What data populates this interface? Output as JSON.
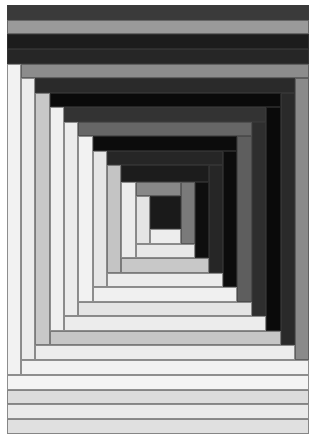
{
  "figure": {
    "caption": "",
    "bounds": {
      "left": 7,
      "top": 5,
      "right": 309,
      "bottom": 434
    }
  },
  "palette": {
    "black": "#0b0b0b",
    "very_dark": "#1e1e1e",
    "dark": "#2c2c2c",
    "mid_dark": "#3a3a3a",
    "gray": "#8c8c8c",
    "mid_gray": "#666666",
    "light_gray": "#c6c6c6",
    "off_white": "#ececec",
    "white": "#f3f3f3"
  },
  "patches": [
    {
      "name": "top-band-1",
      "x": 7,
      "y": 5,
      "w": 302,
      "h": 15,
      "color": "#3a3a3a"
    },
    {
      "name": "top-band-2",
      "x": 7,
      "y": 20,
      "w": 302,
      "h": 14,
      "color": "#9a9a9a"
    },
    {
      "name": "top-band-3",
      "x": 7,
      "y": 34,
      "w": 302,
      "h": 15,
      "color": "#1c1c1c"
    },
    {
      "name": "top-band-4",
      "x": 7,
      "y": 49,
      "w": 302,
      "h": 15,
      "color": "#262626"
    },
    {
      "name": "left-strip-0",
      "x": 7,
      "y": 64,
      "w": 14,
      "h": 311,
      "color": "#f2f2f2"
    },
    {
      "name": "top-strip-0",
      "x": 21,
      "y": 64,
      "w": 288,
      "h": 14,
      "color": "#8c8c8c"
    },
    {
      "name": "right-strip-0",
      "x": 295,
      "y": 78,
      "w": 14,
      "h": 282,
      "color": "#8a8a8a"
    },
    {
      "name": "bottom-strip-0",
      "x": 21,
      "y": 360,
      "w": 288,
      "h": 15,
      "color": "#f2f2f2"
    },
    {
      "name": "left-strip-1",
      "x": 21,
      "y": 78,
      "w": 14,
      "h": 282,
      "color": "#ececec"
    },
    {
      "name": "top-strip-1",
      "x": 35,
      "y": 78,
      "w": 260,
      "h": 15,
      "color": "#2a2a2a"
    },
    {
      "name": "right-strip-1",
      "x": 281,
      "y": 93,
      "w": 14,
      "h": 252,
      "color": "#2a2a2a"
    },
    {
      "name": "bottom-strip-1",
      "x": 35,
      "y": 345,
      "w": 260,
      "h": 15,
      "color": "#ececec"
    },
    {
      "name": "left-strip-2",
      "x": 35,
      "y": 93,
      "w": 15,
      "h": 252,
      "color": "#c8c8c8"
    },
    {
      "name": "top-strip-2",
      "x": 50,
      "y": 93,
      "w": 231,
      "h": 14,
      "color": "#0a0a0a"
    },
    {
      "name": "right-strip-2",
      "x": 266,
      "y": 107,
      "w": 15,
      "h": 224,
      "color": "#0a0a0a"
    },
    {
      "name": "bottom-strip-2",
      "x": 50,
      "y": 331,
      "w": 231,
      "h": 14,
      "color": "#c6c6c6"
    },
    {
      "name": "left-strip-3",
      "x": 50,
      "y": 107,
      "w": 14,
      "h": 224,
      "color": "#f0f0f0"
    },
    {
      "name": "top-strip-3",
      "x": 64,
      "y": 107,
      "w": 202,
      "h": 15,
      "color": "#333333"
    },
    {
      "name": "right-strip-3",
      "x": 252,
      "y": 122,
      "w": 14,
      "h": 194,
      "color": "#2e2e2e"
    },
    {
      "name": "bottom-strip-3",
      "x": 64,
      "y": 316,
      "w": 202,
      "h": 15,
      "color": "#ececec"
    },
    {
      "name": "left-strip-4",
      "x": 64,
      "y": 122,
      "w": 14,
      "h": 194,
      "color": "#ececec"
    },
    {
      "name": "top-strip-4",
      "x": 78,
      "y": 122,
      "w": 174,
      "h": 14,
      "color": "#666666"
    },
    {
      "name": "right-strip-4",
      "x": 237,
      "y": 136,
      "w": 15,
      "h": 166,
      "color": "#5e5e5e"
    },
    {
      "name": "bottom-strip-4",
      "x": 78,
      "y": 302,
      "w": 174,
      "h": 14,
      "color": "#e4e4e4"
    },
    {
      "name": "left-strip-5",
      "x": 78,
      "y": 136,
      "w": 15,
      "h": 166,
      "color": "#f2f2f2"
    },
    {
      "name": "top-strip-5",
      "x": 93,
      "y": 136,
      "w": 144,
      "h": 15,
      "color": "#0c0c0c"
    },
    {
      "name": "right-strip-5",
      "x": 223,
      "y": 151,
      "w": 14,
      "h": 136,
      "color": "#0c0c0c"
    },
    {
      "name": "bottom-strip-5",
      "x": 93,
      "y": 287,
      "w": 144,
      "h": 15,
      "color": "#f0f0f0"
    },
    {
      "name": "left-strip-6",
      "x": 93,
      "y": 151,
      "w": 14,
      "h": 136,
      "color": "#e6e6e6"
    },
    {
      "name": "top-strip-6",
      "x": 107,
      "y": 151,
      "w": 116,
      "h": 14,
      "color": "#262626"
    },
    {
      "name": "right-strip-6",
      "x": 209,
      "y": 165,
      "w": 14,
      "h": 108,
      "color": "#262626"
    },
    {
      "name": "bottom-strip-6",
      "x": 107,
      "y": 273,
      "w": 116,
      "h": 14,
      "color": "#ececec"
    },
    {
      "name": "left-strip-7",
      "x": 107,
      "y": 165,
      "w": 14,
      "h": 108,
      "color": "#c4c4c4"
    },
    {
      "name": "top-strip-7",
      "x": 121,
      "y": 165,
      "w": 88,
      "h": 17,
      "color": "#1c1c1c"
    },
    {
      "name": "right-strip-7",
      "x": 195,
      "y": 182,
      "w": 14,
      "h": 76,
      "color": "#0e0e0e"
    },
    {
      "name": "bottom-strip-7",
      "x": 121,
      "y": 258,
      "w": 88,
      "h": 15,
      "color": "#c8c8c8"
    },
    {
      "name": "left-strip-8",
      "x": 121,
      "y": 182,
      "w": 15,
      "h": 76,
      "color": "#ececec"
    },
    {
      "name": "top-strip-8",
      "x": 136,
      "y": 182,
      "w": 45,
      "h": 14,
      "color": "#888888"
    },
    {
      "name": "right-strip-8",
      "x": 181,
      "y": 182,
      "w": 14,
      "h": 62,
      "color": "#7a7a7a"
    },
    {
      "name": "bottom-strip-8",
      "x": 136,
      "y": 244,
      "w": 59,
      "h": 14,
      "color": "#e8e8e8"
    },
    {
      "name": "left-strip-9",
      "x": 136,
      "y": 196,
      "w": 14,
      "h": 48,
      "color": "#e4e4e4"
    },
    {
      "name": "center-square",
      "x": 150,
      "y": 196,
      "w": 31,
      "h": 33,
      "color": "#1a1a1a"
    },
    {
      "name": "bottom-strip-9",
      "x": 150,
      "y": 229,
      "w": 31,
      "h": 15,
      "color": "#ededed"
    },
    {
      "name": "bottom-band-1",
      "x": 7,
      "y": 375,
      "w": 302,
      "h": 15,
      "color": "#f4f4f4"
    },
    {
      "name": "bottom-band-2",
      "x": 7,
      "y": 390,
      "w": 302,
      "h": 14,
      "color": "#dcdcdc"
    },
    {
      "name": "bottom-band-3",
      "x": 7,
      "y": 404,
      "w": 302,
      "h": 15,
      "color": "#eaeaea"
    },
    {
      "name": "bottom-band-4",
      "x": 7,
      "y": 419,
      "w": 302,
      "h": 15,
      "color": "#e0e0e0"
    }
  ]
}
